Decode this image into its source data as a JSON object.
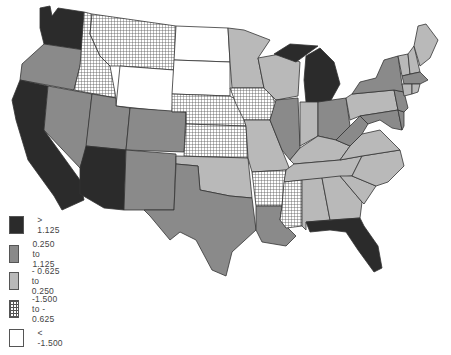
{
  "map": {
    "type": "choropleth",
    "region": "United States (contiguous)",
    "legend": [
      {
        "label": "> 1.125",
        "class": "c1",
        "fill": "#2b2b2b"
      },
      {
        "label": "0.250 to 1.125",
        "class": "c2",
        "fill": "#8a8a8a"
      },
      {
        "label": "- 0.625 to 0.250",
        "class": "c3",
        "fill": "#b9b9b9"
      },
      {
        "label": "-1.500 to - 0.625",
        "class": "c4",
        "fill": "crosshatch"
      },
      {
        "label": "< -1.500",
        "class": "c5",
        "fill": "#ffffff"
      }
    ],
    "states": {
      "WA": "c1",
      "OR": "c2",
      "CA": "c1",
      "NV": "c2",
      "ID": "c4",
      "MT": "c4",
      "WY": "c5",
      "UT": "c2",
      "AZ": "c1",
      "CO": "c2",
      "NM": "c2",
      "ND": "c5",
      "SD": "c5",
      "NE": "c4",
      "KS": "c4",
      "OK": "c3",
      "TX": "c2",
      "MN": "c3",
      "IA": "c4",
      "MO": "c3",
      "AR": "c4",
      "LA": "c2",
      "WI": "c3",
      "IL": "c2",
      "MI": "c1",
      "IN": "c3",
      "OH": "c2",
      "KY": "c3",
      "TN": "c3",
      "MS": "c4",
      "AL": "c3",
      "GA": "c3",
      "FL": "c1",
      "SC": "c3",
      "NC": "c3",
      "VA": "c3",
      "WV": "c2",
      "PA": "c3",
      "NY": "c2",
      "VT": "c3",
      "NH": "c3",
      "ME": "c3",
      "MA": "c2",
      "CT": "c3",
      "RI": "c3",
      "NJ": "c2",
      "DE": "c2",
      "MD": "c2"
    }
  }
}
